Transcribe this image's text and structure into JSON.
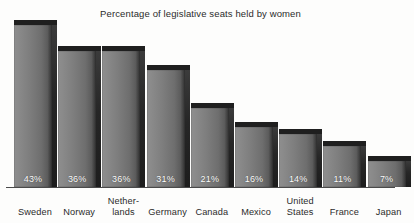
{
  "chart_data": {
    "type": "bar",
    "title": "Percentage of legislative seats held by women",
    "xlabel": "",
    "ylabel": "",
    "ylim": [
      0,
      46
    ],
    "grid": false,
    "legend": "none",
    "style": "3d-shaded-bars-grayscale",
    "value_label_suffix": "%",
    "categories": [
      "Sweden",
      "Norway",
      "Nether-lands",
      "Germany",
      "Canada",
      "Mexico",
      "United States",
      "France",
      "Japan"
    ],
    "values": [
      43,
      36,
      36,
      31,
      21,
      16,
      14,
      11,
      7
    ],
    "value_labels": [
      "43%",
      "36%",
      "36%",
      "31%",
      "21%",
      "16%",
      "14%",
      "11%",
      "7%"
    ],
    "bars": [
      {
        "category": "Sweden",
        "label_lines": [
          "Sweden"
        ],
        "value": 43,
        "value_label": "43%"
      },
      {
        "category": "Norway",
        "label_lines": [
          "Norway"
        ],
        "value": 36,
        "value_label": "36%"
      },
      {
        "category": "Netherlands",
        "label_lines": [
          "Nether-",
          "lands"
        ],
        "value": 36,
        "value_label": "36%"
      },
      {
        "category": "Germany",
        "label_lines": [
          "Germany"
        ],
        "value": 31,
        "value_label": "31%"
      },
      {
        "category": "Canada",
        "label_lines": [
          "Canada"
        ],
        "value": 21,
        "value_label": "21%"
      },
      {
        "category": "Mexico",
        "label_lines": [
          "Mexico"
        ],
        "value": 16,
        "value_label": "16%"
      },
      {
        "category": "United States",
        "label_lines": [
          "United",
          "States"
        ],
        "value": 14,
        "value_label": "14%"
      },
      {
        "category": "France",
        "label_lines": [
          "France"
        ],
        "value": 11,
        "value_label": "11%"
      },
      {
        "category": "Japan",
        "label_lines": [
          "Japan"
        ],
        "value": 7,
        "value_label": "7%"
      }
    ]
  },
  "colors": {
    "background": "#fdfdfc",
    "bar_face_light": "#8e8e8e",
    "bar_face_dark": "#2e2e2e",
    "bar_side": "#262626",
    "bar_top": "#1f1f1f",
    "axis": "#4a4a4a",
    "text": "#2b2b2b",
    "value_text": "#ffffff"
  }
}
